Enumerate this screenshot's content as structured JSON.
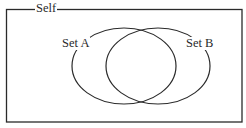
{
  "diagram": {
    "type": "venn",
    "universe": {
      "label": "Self"
    },
    "sets": [
      {
        "label": "Set A"
      },
      {
        "label": "Set B"
      }
    ],
    "colors": {
      "stroke": "#2a2a2a",
      "background": "#ffffff",
      "text": "#2a2a2a"
    }
  }
}
